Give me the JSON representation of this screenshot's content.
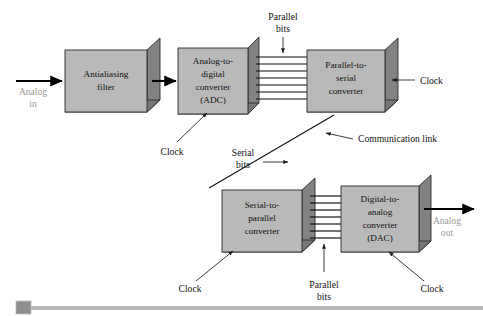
{
  "figure": {
    "kind": "block-diagram",
    "title_text": "",
    "background_color": "#ffffff",
    "block_face_color": "#b9b9b9",
    "block_shadow_color": "#828282",
    "wire_color": "#111111",
    "io_label_color": "#9a9a9a"
  },
  "blocks": [
    {
      "id": "antialiasing-filter",
      "name": "antialiasing-filter-block",
      "lines": [
        "Antialiasing",
        "filter"
      ],
      "x": 65,
      "y": 50,
      "w": 82,
      "h": 62
    },
    {
      "id": "adc",
      "name": "analog-to-digital-converter-block",
      "lines": [
        "Analog-to-",
        "digital",
        "converter",
        "(ADC)"
      ],
      "x": 178,
      "y": 48,
      "w": 70,
      "h": 66
    },
    {
      "id": "parallel-to-serial",
      "name": "parallel-to-serial-converter-block",
      "lines": [
        "Parallel-to-",
        "serial",
        "converter"
      ],
      "x": 307,
      "y": 50,
      "w": 78,
      "h": 62
    },
    {
      "id": "serial-to-parallel",
      "name": "serial-to-parallel-converter-block",
      "lines": [
        "Serial-to-",
        "parallel",
        "converter"
      ],
      "x": 222,
      "y": 190,
      "w": 80,
      "h": 62
    },
    {
      "id": "dac",
      "name": "digital-to-analog-converter-block",
      "lines": [
        "Digital-to-",
        "analog",
        "converter",
        "(DAC)"
      ],
      "x": 341,
      "y": 186,
      "w": 78,
      "h": 66
    }
  ],
  "labels": {
    "analog_in_line1": "Analog",
    "analog_in_line2": "in",
    "analog_out_line1": "Analog",
    "analog_out_line2": "out",
    "parallel_bits_top_line1": "Parallel",
    "parallel_bits_top_line2": "bits",
    "parallel_bits_bottom_line1": "Parallel",
    "parallel_bits_bottom_line2": "bits",
    "serial_bits_line1": "Serial",
    "serial_bits_line2": "bits",
    "communication_link": "Communication link",
    "clock_adc": "Clock",
    "clock_parallel_to_serial": "Clock",
    "clock_serial_to_parallel": "Clock",
    "clock_dac": "Clock"
  },
  "buses": {
    "top_bus_line_count": 7,
    "bottom_bus_line_count": 7
  },
  "scrollbar": {
    "name": "horizontal-scrollbar",
    "thumb_position_percent": 0
  }
}
